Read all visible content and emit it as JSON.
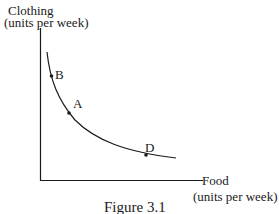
{
  "figure": {
    "y_axis_label_line1": "Clothing",
    "y_axis_label_line2": "(units per week)",
    "x_axis_label_line1": "Food",
    "x_axis_label_line2": "(units per week)",
    "caption": "Figure 3.1",
    "points": [
      {
        "label": "B",
        "description": "point on curve, high clothing / low food"
      },
      {
        "label": "A",
        "description": "point on curve, middle"
      },
      {
        "label": "D",
        "description": "point on curve, low clothing / high food"
      }
    ],
    "curve_type": "indifference curve (convex to origin)"
  },
  "colors": {
    "line": "#1a1a1a",
    "background": "#ffffff"
  }
}
